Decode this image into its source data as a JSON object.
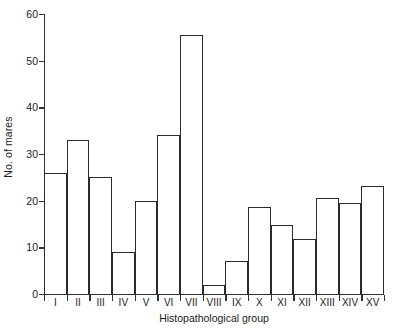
{
  "chart_data": {
    "type": "bar",
    "title": "",
    "subtitle": "",
    "xlabel": "Histopathological group",
    "ylabel": "No. of mares",
    "categories": [
      "I",
      "II",
      "III",
      "IV",
      "V",
      "VI",
      "VII",
      "VIII",
      "IX",
      "X",
      "XI",
      "XII",
      "XIII",
      "XIV",
      "XV"
    ],
    "values": [
      26,
      33,
      25,
      9,
      20,
      34,
      55.5,
      2,
      7,
      18.7,
      14.7,
      11.7,
      20.6,
      19.6,
      23.2
    ],
    "ylim": [
      0,
      60
    ],
    "yticks": [
      0,
      10,
      20,
      30,
      40,
      50,
      60
    ],
    "ytick_labels": [
      "0",
      "10",
      "20",
      "30",
      "40",
      "50",
      "60"
    ],
    "grid": false,
    "legend": false,
    "legend_position": "none",
    "bar_style": "outlined",
    "bar_fill": "#ffffff",
    "bar_edge": "#2b2b2b",
    "axis_color": "#333333",
    "background": "#ffffff"
  }
}
